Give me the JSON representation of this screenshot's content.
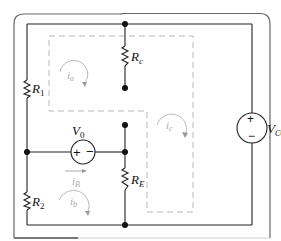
{
  "diagram": {
    "type": "circuit",
    "labels": {
      "r1": {
        "main": "R",
        "sub": "1"
      },
      "r2": {
        "main": "R",
        "sub": "2"
      },
      "rc": {
        "main": "R",
        "sub": "c"
      },
      "re": {
        "main": "R",
        "sub": "E"
      },
      "v0": {
        "main": "V",
        "sub": "0"
      },
      "vcc": {
        "main": "V",
        "sub": "CC"
      },
      "ib": {
        "main": "i",
        "sub": "B"
      }
    },
    "meshes": [
      {
        "id": "ia",
        "main": "i",
        "sub": "a"
      },
      {
        "id": "ib",
        "main": "i",
        "sub": "b"
      },
      {
        "id": "ic",
        "main": "i",
        "sub": "c"
      }
    ],
    "source_symbols": {
      "plus": "+",
      "minus": "−"
    },
    "colors": {
      "wire": "#222222",
      "frame": "#555555",
      "dashed": "#b0b0b0",
      "mesh_label": "#aaaaaa"
    }
  }
}
